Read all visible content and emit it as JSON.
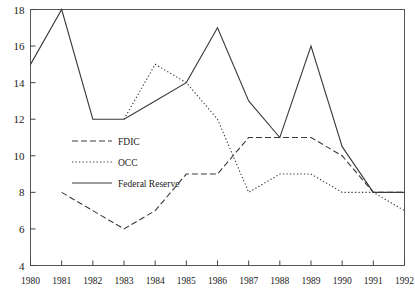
{
  "chart_data": {
    "type": "line",
    "title": "",
    "xlabel": "",
    "ylabel": "",
    "x": [
      1980,
      1981,
      1982,
      1983,
      1984,
      1985,
      1986,
      1987,
      1988,
      1989,
      1990,
      1991,
      1992
    ],
    "categories": [
      "1980",
      "1981",
      "1982",
      "1983",
      "1984",
      "1985",
      "1986",
      "1987",
      "1988",
      "1989",
      "1990",
      "1991",
      "1992"
    ],
    "xlim": [
      1980,
      1992
    ],
    "ylim": [
      4,
      18
    ],
    "y_ticks": [
      4,
      6,
      8,
      10,
      12,
      14,
      16,
      18
    ],
    "y_tick_labels": [
      "4",
      "6",
      "8",
      "10",
      "12",
      "14",
      "16",
      "18"
    ],
    "grid": false,
    "legend_position": "center-left",
    "series": [
      {
        "name": "FDIC",
        "style": "dashed",
        "color": "#3a3a3a",
        "x": [
          1981,
          1982,
          1983,
          1984,
          1985,
          1986,
          1987,
          1988,
          1989,
          1990,
          1991,
          1992
        ],
        "values": [
          8,
          7,
          6,
          7,
          9,
          9,
          11,
          11,
          11,
          10,
          8,
          8
        ]
      },
      {
        "name": "OCC",
        "style": "dotted",
        "color": "#3a3a3a",
        "x": [
          1983,
          1984,
          1985,
          1986,
          1987,
          1988,
          1989,
          1990,
          1991,
          1992
        ],
        "values": [
          12,
          15,
          14,
          12,
          8,
          9,
          9,
          8,
          8,
          7
        ]
      },
      {
        "name": "Federal Reserve",
        "style": "solid",
        "color": "#3a3a3a",
        "x": [
          1980,
          1981,
          1982,
          1983,
          1984,
          1985,
          1986,
          1987,
          1988,
          1989,
          1990,
          1991,
          1992
        ],
        "values": [
          15,
          18,
          12,
          12,
          13,
          14,
          17,
          13,
          11,
          16,
          10.5,
          8,
          8
        ]
      }
    ],
    "legend": [
      {
        "label": "FDIC",
        "style": "dashed"
      },
      {
        "label": "OCC",
        "style": "dotted"
      },
      {
        "label": "Federal Reserve",
        "style": "solid"
      }
    ]
  }
}
